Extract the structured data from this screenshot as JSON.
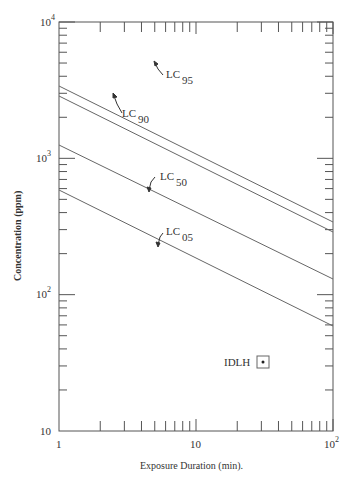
{
  "chart_data": {
    "type": "line",
    "title": "",
    "xlabel": "Exposure Duration (min).",
    "ylabel": "Concentration (ppm)",
    "xscale": "log",
    "yscale": "log",
    "xlim": [
      1,
      100
    ],
    "ylim": [
      10,
      10000
    ],
    "x_tick_labels": [
      "1",
      "10",
      "10^2"
    ],
    "y_tick_labels": [
      "10",
      "10^2",
      "10^3",
      "10^4"
    ],
    "grid": false,
    "legend": "none (inline labels)",
    "x": [
      1,
      100
    ],
    "series": [
      {
        "name": "LC95",
        "label_main": "LC",
        "label_sub": "95",
        "values": [
          3400,
          340
        ]
      },
      {
        "name": "LC90",
        "label_main": "LC",
        "label_sub": "90",
        "values": [
          2900,
          290
        ]
      },
      {
        "name": "LC50",
        "label_main": "LC",
        "label_sub": "50",
        "values": [
          1250,
          120
        ]
      },
      {
        "name": "LC05",
        "label_main": "LC",
        "label_sub": "05",
        "values": [
          590,
          55
        ]
      }
    ],
    "annotations": [
      {
        "label": "IDLH",
        "x": 30,
        "y": 30,
        "marker": "boxed-dot"
      }
    ]
  },
  "labels": {
    "x_axis": "Exposure Duration (min).",
    "y_axis": "Concentration (ppm)",
    "x1": "1",
    "x10": "10",
    "x100_base": "10",
    "x100_exp": "2",
    "y10": "10",
    "y100_base": "10",
    "y100_exp": "2",
    "y1000_base": "10",
    "y1000_exp": "3",
    "y10000_base": "10",
    "y10000_exp": "4",
    "idlh": "IDLH",
    "lc": "LC",
    "lc95_sub": "95",
    "lc90_sub": "90",
    "lc50_sub": "50",
    "lc05_sub": "05"
  }
}
